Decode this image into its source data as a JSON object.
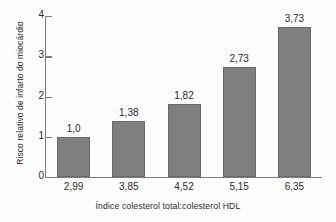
{
  "chart_data": {
    "type": "bar",
    "title": "",
    "subtitle": "",
    "xlabel": "Índice colesterol total:colesterol HDL",
    "ylabel": "Risco relativo de infarto do miocárdio",
    "categories": [
      "2,99",
      "3,85",
      "4,52",
      "5,15",
      "6,35"
    ],
    "values": [
      1.0,
      1.38,
      1.82,
      2.73,
      3.73
    ],
    "value_labels": [
      "1,0",
      "1,38",
      "1,82",
      "2,73",
      "3,73"
    ],
    "ylim": [
      0,
      4
    ],
    "ytick_labels": [
      "0",
      "1",
      "2",
      "3",
      "4"
    ],
    "ytick_values": [
      0,
      1,
      2,
      3,
      4
    ],
    "grid": false,
    "legend": null,
    "legend_position": "none",
    "bar_color": "#7f7f7f",
    "bar_edge_color": "#6a6a6a",
    "axis_color": "#7c7c7c",
    "text_color": "#2b2b2b",
    "background_color": "#fdfdfd"
  }
}
